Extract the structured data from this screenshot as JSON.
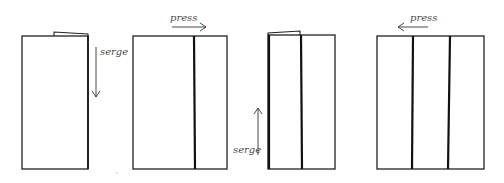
{
  "diagram": {
    "steps": [
      {
        "step": 1,
        "label": "serge",
        "arrow_direction": "down",
        "panels": 1
      },
      {
        "step": 2,
        "label": "press",
        "arrow_direction": "right",
        "panels": 2
      },
      {
        "step": 3,
        "label": "serge",
        "arrow_direction": "up",
        "panels": 2
      },
      {
        "step": 4,
        "label": "press",
        "arrow_direction": "left",
        "panels": 3
      }
    ],
    "colors": {
      "line": "#222222",
      "seam": "#111111",
      "label": "#4a4a4a",
      "background": "#ffffff"
    }
  }
}
